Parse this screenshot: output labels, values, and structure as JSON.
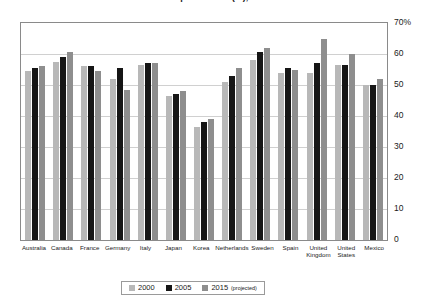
{
  "chart_data": {
    "type": "bar",
    "title": "Labour Force Participation Rate (%), Selected Countries",
    "xlabel": "",
    "ylabel": "",
    "ylim": [
      0,
      70
    ],
    "ytick_step": 10,
    "ytick_labels": [
      "70%",
      "60",
      "50",
      "40",
      "30",
      "20",
      "10",
      "0"
    ],
    "ytick_values": [
      70,
      60,
      50,
      40,
      30,
      20,
      10,
      0
    ],
    "grid": true,
    "legend_position": "bottom",
    "categories": [
      "Australia",
      "Canada",
      "France",
      "Germany",
      "Italy",
      "Japan",
      "Korea",
      "Netherlands",
      "Sweden",
      "Spain",
      "United Kingdom",
      "United States",
      "Mexico"
    ],
    "category_lines": [
      [
        "Australia",
        ""
      ],
      [
        "Canada",
        ""
      ],
      [
        "France",
        ""
      ],
      [
        "Germany",
        ""
      ],
      [
        "Italy",
        ""
      ],
      [
        "Japan",
        ""
      ],
      [
        "Korea",
        ""
      ],
      [
        "Netherlands",
        ""
      ],
      [
        "Sweden",
        ""
      ],
      [
        "Spain",
        ""
      ],
      [
        "United",
        "Kingdom"
      ],
      [
        "United",
        "States"
      ],
      [
        "Mexico",
        ""
      ]
    ],
    "series": [
      {
        "name": "2000",
        "color": "#b8b8b8",
        "values": [
          54.5,
          57.5,
          56.0,
          52.0,
          56.5,
          46.5,
          36.5,
          51.0,
          58.0,
          54.0,
          54.0,
          56.5,
          50.0
        ]
      },
      {
        "name": "2005",
        "color": "#161616",
        "values": [
          55.5,
          59.0,
          56.0,
          55.5,
          57.0,
          47.0,
          38.0,
          53.0,
          60.5,
          55.5,
          57.0,
          56.5,
          50.0
        ]
      },
      {
        "name": "2015 (projected)",
        "color": "#8e8e8e",
        "values": [
          56.0,
          60.5,
          54.5,
          48.5,
          57.0,
          48.0,
          39.0,
          55.5,
          62.0,
          55.0,
          65.0,
          60.0,
          52.0
        ]
      }
    ]
  },
  "legend": {
    "entries": [
      {
        "label": "2000",
        "note": ""
      },
      {
        "label": "2005",
        "note": ""
      },
      {
        "label": "2015",
        "note": "(projected)"
      }
    ]
  }
}
